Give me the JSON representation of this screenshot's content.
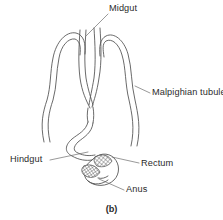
{
  "figure": {
    "caption": "(b)",
    "background_color": "#ffffff",
    "line_color": "#4a4a4a",
    "text_color": "#2b2b2b"
  },
  "labels": {
    "midgut": "Midgut",
    "malpighian_tubule": "Malpighian tubule",
    "hindgut": "Hindgut",
    "rectum": "Rectum",
    "anus": "Anus"
  },
  "leader_lines": [
    {
      "name": "midgut-leader",
      "from": [
        108,
        14
      ],
      "to": [
        86,
        36
      ]
    },
    {
      "name": "malpighian-leader",
      "from": [
        150,
        93
      ],
      "to": [
        136,
        86
      ]
    },
    {
      "name": "hindgut-leader",
      "from": [
        50,
        160
      ],
      "to": [
        88,
        152
      ]
    },
    {
      "name": "rectum-leader",
      "from": [
        139,
        163
      ],
      "to": [
        110,
        157
      ]
    },
    {
      "name": "anus-leader",
      "from": [
        124,
        190
      ],
      "to": [
        98,
        179
      ]
    }
  ],
  "structures": [
    {
      "name": "midgut-tube",
      "description": "central narrow tube opening upward"
    },
    {
      "name": "malpighian-tubule-left",
      "description": "left looping wavy tubule"
    },
    {
      "name": "malpighian-tubule-right",
      "description": "right looping wavy tubule"
    },
    {
      "name": "hindgut-tube",
      "description": "curving tube from junction to rectum"
    },
    {
      "name": "rectum-sac",
      "description": "cross-hatched rectal sac"
    },
    {
      "name": "anus-opening",
      "description": "terminal opening at base"
    }
  ]
}
